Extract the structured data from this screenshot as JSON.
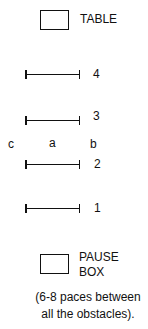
{
  "diagram": {
    "table": {
      "label": "TABLE"
    },
    "obstacles": [
      {
        "number": "4"
      },
      {
        "number": "3"
      },
      {
        "number": "2"
      },
      {
        "number": "1"
      }
    ],
    "positions": {
      "c": "c",
      "a": "a",
      "b": "b"
    },
    "pause_box": {
      "line1": "PAUSE",
      "line2": "BOX"
    },
    "caption": {
      "line1": "(6-8 paces between",
      "line2": "all the obstacles)."
    }
  }
}
